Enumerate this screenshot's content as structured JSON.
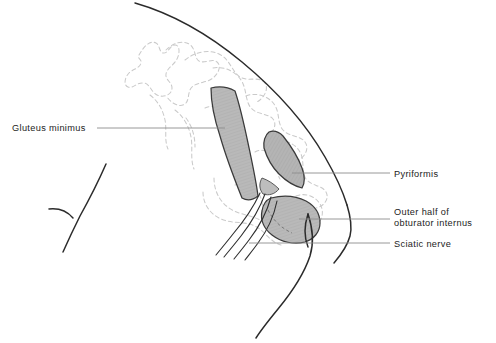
{
  "figure": {
    "kind": "anatomical-line-drawing",
    "background_color": "#ffffff",
    "ink_color": "#232323",
    "muscle_fill_color": "#b8b8b8",
    "muscle_outline_color": "#3a3a3a",
    "bone_dash_color": "#c9c9c9",
    "leader_line_color": "#8d8d8d"
  },
  "labels": [
    {
      "id": "gluteus-minimus",
      "text": "Gluteus minimus",
      "side": "left",
      "text_x": 12,
      "text_y": 131,
      "anchor": "start",
      "leader": "M 97 128 L 225 128"
    },
    {
      "id": "pyriformis",
      "text": "Pyriformis",
      "side": "right",
      "text_x": 394,
      "text_y": 177,
      "anchor": "start",
      "leader": "M 390 173 L 292 173"
    },
    {
      "id": "outer-half-obturator-internus",
      "text": "Outer half of",
      "text_line2": "obturator internus",
      "side": "right",
      "text_x": 394,
      "text_y": 215,
      "text_y2": 226,
      "anchor": "start",
      "leader": "M 390 219 L 299 219"
    },
    {
      "id": "sciatic-nerve",
      "text": "Sciatic nerve",
      "side": "right",
      "text_x": 394,
      "text_y": 247,
      "anchor": "start",
      "leader": "M 390 243 L 249 243"
    }
  ],
  "structures": [
    {
      "id": "body-outline-upper",
      "name": "iliac-crest-and-hip-contour"
    },
    {
      "id": "body-outline-lateral",
      "name": "lateral-thigh-contour"
    },
    {
      "id": "body-outline-lower",
      "name": "posterior-thigh-contour"
    },
    {
      "id": "gluteal-fold",
      "name": "gluteal-fold-contour"
    },
    {
      "id": "sacrum-dashed",
      "name": "sacrum-hidden-outline"
    },
    {
      "id": "ilium-dashed",
      "name": "ilium-hidden-outline"
    },
    {
      "id": "ischium-dashed",
      "name": "ischium-hidden-outline"
    },
    {
      "id": "gluteus-minimus-shape",
      "name": "gluteus-minimus-muscle"
    },
    {
      "id": "pyriformis-shape",
      "name": "pyriformis-muscle"
    },
    {
      "id": "obturator-internus-shape",
      "name": "obturator-internus-muscle"
    },
    {
      "id": "sciatic-nerve-strands",
      "name": "sciatic-nerve-fibers"
    }
  ],
  "caption": {
    "text": ""
  }
}
